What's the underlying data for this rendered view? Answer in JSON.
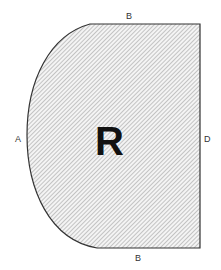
{
  "diagram": {
    "region_label": "R",
    "edge_labels": {
      "top": "B",
      "left": "A",
      "right": "D",
      "bottom": "B"
    },
    "colors": {
      "outline": "#333333",
      "hatch": "#9a9a9a",
      "fill": "#f4f4f4",
      "label": "#333333",
      "region_label": "#111111"
    }
  }
}
